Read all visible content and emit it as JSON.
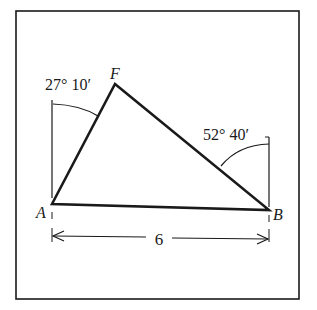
{
  "figure": {
    "vertices": {
      "A": {
        "label": "A"
      },
      "B": {
        "label": "B"
      },
      "F": {
        "label": "F"
      }
    },
    "angles": {
      "at_A": "27° 10′",
      "at_B": "52° 40′"
    },
    "base_length": "6",
    "colors": {
      "stroke": "#1a1a1a",
      "background": "#ffffff"
    }
  }
}
